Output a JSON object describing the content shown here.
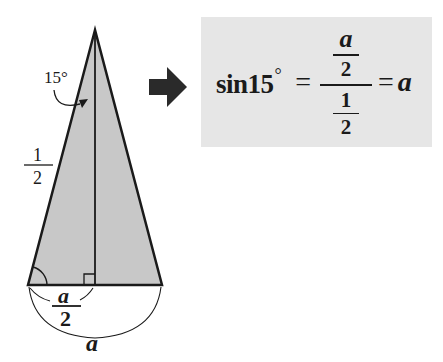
{
  "diagram": {
    "triangle": {
      "apex_angle_label": "15°",
      "side_label": {
        "numerator": "1",
        "denominator": "2"
      },
      "half_base_label": {
        "numerator": "a",
        "denominator": "2"
      },
      "base_label": "a",
      "fill_color": "#c8c8c8",
      "stroke_color": "#1a1a1a"
    },
    "arrow": {
      "icon": "right-arrow-icon",
      "color": "#2a2a2a"
    },
    "formula": {
      "lhs": "sin15",
      "degree": "°",
      "equals": "=",
      "numerator": {
        "numerator": "a",
        "denominator": "2"
      },
      "denominator": {
        "numerator": "1",
        "denominator": "2"
      },
      "result": "a",
      "box_color": "#e6e6e6"
    }
  }
}
